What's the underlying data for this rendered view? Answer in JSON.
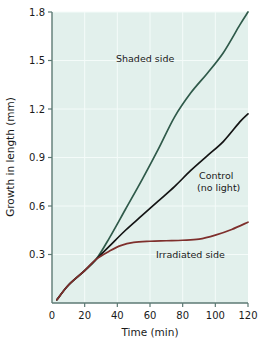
{
  "chart_data": {
    "type": "line",
    "title": "",
    "xlabel": "Time (min)",
    "ylabel": "Growth in length (mm)",
    "xlim": [
      0,
      120
    ],
    "ylim": [
      0,
      1.8
    ],
    "xticks": [
      0,
      20,
      40,
      60,
      80,
      100,
      120
    ],
    "xtick_labels": [
      "0",
      "20",
      "40",
      "60",
      "80",
      "100",
      "120"
    ],
    "yticks": [
      0.3,
      0.6,
      0.9,
      1.2,
      1.5,
      1.8
    ],
    "ytick_labels": [
      "0.3",
      "0.6",
      "0.9",
      "1.2",
      "1.5",
      "1.8"
    ],
    "grid": true,
    "legend_position": "inline-annotations",
    "series": [
      {
        "name": "Shaded side",
        "color": "#2f5a4a",
        "x": [
          3,
          10,
          20,
          27,
          35,
          45,
          55,
          65,
          75,
          85,
          95,
          105,
          115,
          120
        ],
        "values": [
          0.02,
          0.11,
          0.2,
          0.27,
          0.4,
          0.58,
          0.76,
          0.95,
          1.15,
          1.3,
          1.42,
          1.55,
          1.72,
          1.8
        ]
      },
      {
        "name": "Control (no light)",
        "color": "#141414",
        "x": [
          3,
          10,
          20,
          27,
          35,
          45,
          55,
          65,
          75,
          85,
          95,
          105,
          115,
          120
        ],
        "values": [
          0.02,
          0.11,
          0.2,
          0.27,
          0.35,
          0.45,
          0.54,
          0.63,
          0.72,
          0.82,
          0.91,
          1.0,
          1.12,
          1.17
        ]
      },
      {
        "name": "Irradiated side",
        "color": "#7e2f2c",
        "x": [
          3,
          10,
          20,
          27,
          35,
          42,
          50,
          60,
          70,
          80,
          90,
          100,
          110,
          120
        ],
        "values": [
          0.02,
          0.11,
          0.2,
          0.27,
          0.32,
          0.355,
          0.375,
          0.382,
          0.385,
          0.388,
          0.395,
          0.42,
          0.455,
          0.5
        ]
      }
    ],
    "annotations": [
      {
        "text": "Shaded side",
        "x_px": 116,
        "y_px": 62
      },
      {
        "text": "Control",
        "x_px": 199,
        "y_px": 179
      },
      {
        "text": "(no light)",
        "x_px": 197,
        "y_px": 191
      },
      {
        "text": "Irradiated side",
        "x_px": 156,
        "y_px": 258
      }
    ]
  },
  "colors": {
    "plot_background": "#e2f0ec",
    "grid": "#f4fbf9",
    "axis": "#5d7a74",
    "shaded_side": "#2f5a4a",
    "control": "#141414",
    "irradiated_side": "#7e2f2c"
  }
}
